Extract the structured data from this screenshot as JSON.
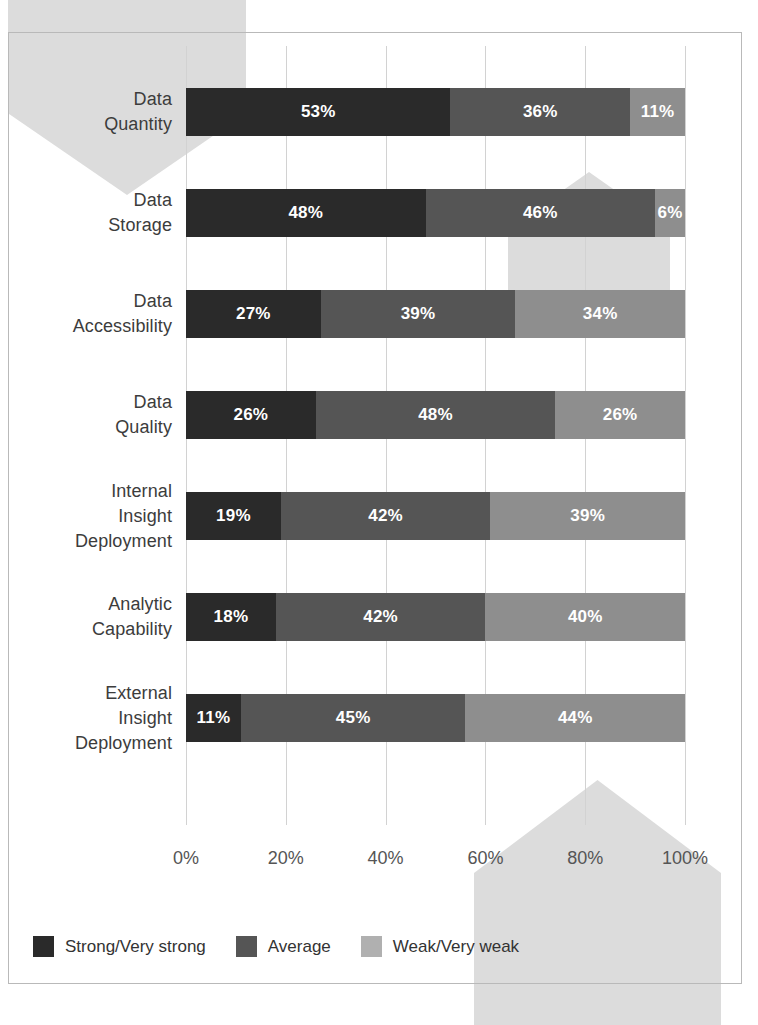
{
  "chart_data": {
    "type": "bar",
    "orientation": "horizontal",
    "stacked": true,
    "normalized_percent": true,
    "title": "",
    "xlabel": "",
    "ylabel": "",
    "xlim": [
      0,
      100
    ],
    "grid": true,
    "legend_position": "bottom-left",
    "xticks": [
      "0%",
      "20%",
      "40%",
      "60%",
      "80%",
      "100%"
    ],
    "xtick_values": [
      0,
      20,
      40,
      60,
      80,
      100
    ],
    "categories": [
      "Data Quantity",
      "Data Storage",
      "Data Accessibility",
      "Data Quality",
      "Internal Insight Deployment",
      "Analytic Capability",
      "External Insight Deployment"
    ],
    "category_lines": [
      [
        "Data",
        "Quantity"
      ],
      [
        "Data",
        "Storage"
      ],
      [
        "Data",
        "Accessibility"
      ],
      [
        "Data",
        "Quality"
      ],
      [
        "Internal",
        "Insight",
        "Deployment"
      ],
      [
        "Analytic",
        "Capability"
      ],
      [
        "External",
        "Insight",
        "Deployment"
      ]
    ],
    "series": [
      {
        "name": "Strong/Very strong",
        "color": "#2a2a2a",
        "values": [
          53,
          48,
          27,
          26,
          19,
          18,
          11
        ],
        "labels": [
          "53%",
          "48%",
          "27%",
          "26%",
          "19%",
          "18%",
          "11%"
        ]
      },
      {
        "name": "Average",
        "color": "#555555",
        "values": [
          36,
          46,
          39,
          48,
          42,
          42,
          45
        ],
        "labels": [
          "36%",
          "46%",
          "39%",
          "48%",
          "42%",
          "42%",
          "45%"
        ]
      },
      {
        "name": "Weak/Very weak",
        "color": "#8e8e8e",
        "values": [
          11,
          6,
          34,
          26,
          39,
          40,
          44
        ],
        "labels": [
          "11%",
          "6%",
          "34%",
          "26%",
          "39%",
          "40%",
          "44%"
        ]
      }
    ]
  },
  "legend": {
    "items": [
      {
        "label": "Strong/Very strong",
        "swatch": "s0"
      },
      {
        "label": "Average",
        "swatch": "s1"
      },
      {
        "label": "Weak/Very weak",
        "swatch": "s2"
      }
    ]
  },
  "source": {
    "text": ""
  },
  "colors": {
    "strong": "#2a2a2a",
    "average": "#555555",
    "weak": "#8e8e8e",
    "watermark": "#dcdcdc",
    "gridline": "#d2d2d2",
    "frame": "#b9b9b9"
  }
}
